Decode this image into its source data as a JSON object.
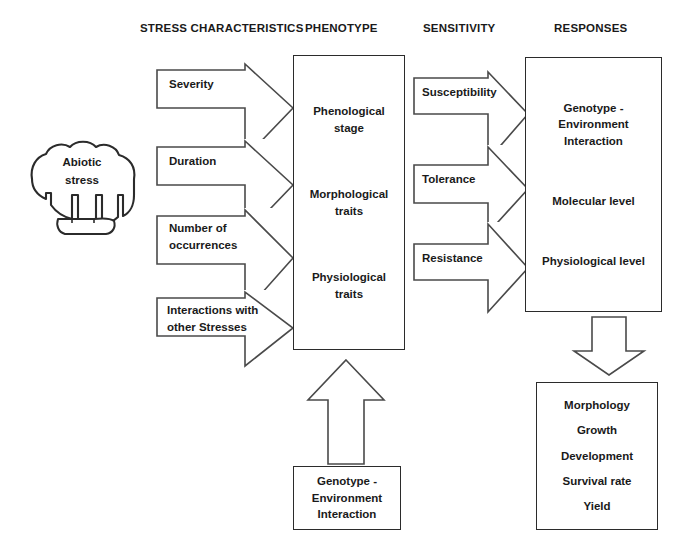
{
  "headers": [
    {
      "label": "STRESS CHARACTERISTICS",
      "x": 140,
      "y": 22
    },
    {
      "label": "PHENOTYPE",
      "x": 305,
      "y": 22
    },
    {
      "label": "SENSITIVITY",
      "x": 423,
      "y": 22
    },
    {
      "label": "RESPONSES",
      "x": 554,
      "y": 22
    }
  ],
  "source": {
    "label": "Abiotic\nstress"
  },
  "stress_characteristics": [
    {
      "label": "Severity"
    },
    {
      "label": "Duration"
    },
    {
      "label": "Number of\noccurrences"
    },
    {
      "label": "Interactions with\nother Stresses"
    }
  ],
  "phenotype": {
    "items": [
      "Phenological\nstage",
      "Morphological\ntraits",
      "Physiological\ntraits"
    ]
  },
  "sensitivity": [
    {
      "label": "Susceptibility"
    },
    {
      "label": "Tolerance"
    },
    {
      "label": "Resistance"
    }
  ],
  "responses": {
    "items": [
      "Genotype -\nEnvironment\nInteraction",
      "Molecular  level",
      "Physiological level"
    ]
  },
  "outcomes": {
    "items": [
      "Morphology",
      "Growth",
      "Development",
      "Survival rate",
      "Yield"
    ]
  },
  "genotype_input": {
    "items": [
      "Genotype -\nEnvironment\nInteraction"
    ]
  },
  "colors": {
    "stroke": "#2b2b2b",
    "arrow_stroke": "#4a4a4a",
    "text": "#1a1a1a",
    "background": "#ffffff"
  }
}
